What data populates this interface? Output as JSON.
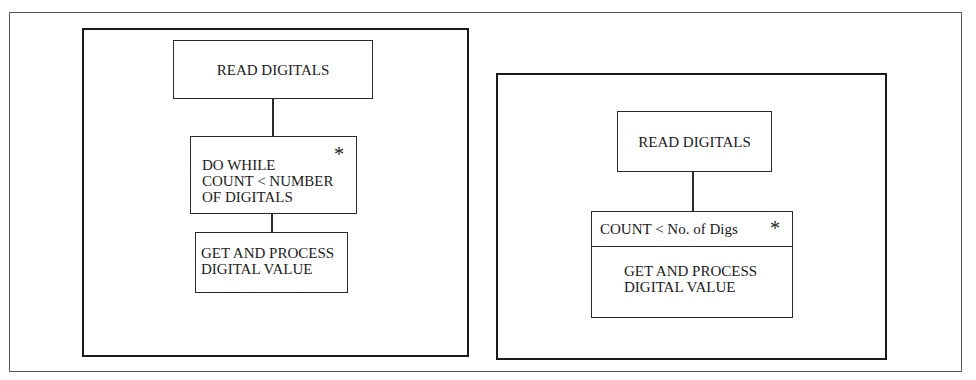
{
  "left_diagram": {
    "read_box": {
      "label": "READ DIGITALS"
    },
    "loop_box": {
      "lines": [
        "DO WHILE",
        "COUNT < NUMBER",
        "OF DIGITALS"
      ],
      "iteration_marker": "*"
    },
    "process_box": {
      "lines": [
        "GET AND PROCESS",
        "DIGITAL VALUE"
      ]
    }
  },
  "right_diagram": {
    "read_box": {
      "label": "READ DIGITALS"
    },
    "combined_box": {
      "condition": "COUNT < No. of Digs",
      "iteration_marker": "*",
      "body_lines": [
        "GET AND PROCESS",
        "DIGITAL VALUE"
      ]
    }
  }
}
